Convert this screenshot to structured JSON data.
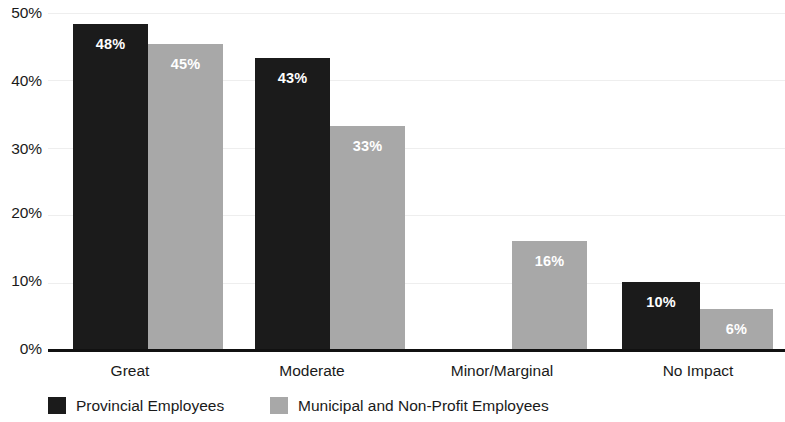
{
  "chart_data": {
    "type": "bar",
    "title": "",
    "subtitle": "",
    "xlabel": "",
    "ylabel": "",
    "categories": [
      "Great",
      "Moderate",
      "Minor/Marginal",
      "No Impact"
    ],
    "series": [
      {
        "name": "Provincial Employees",
        "color": "#1b1b1b",
        "values": [
          48,
          43,
          0,
          10
        ],
        "labels": [
          "48%",
          "43%",
          "",
          "10%"
        ]
      },
      {
        "name": "Municipal and Non-Profit Employees",
        "color": "#a8a8a8",
        "values": [
          45,
          33,
          16,
          6
        ],
        "labels": [
          "45%",
          "33%",
          "16%",
          "6%"
        ]
      }
    ],
    "ylim": [
      0,
      50
    ],
    "ytick_values": [
      0,
      10,
      20,
      30,
      40,
      50
    ],
    "ytick_labels": [
      "0%",
      "10%",
      "20%",
      "30%",
      "40%",
      "50%"
    ],
    "grid": true,
    "grid_color": "#eeeeee",
    "legend_position": "bottom",
    "axis_color": "#111111",
    "background": "#ffffff"
  },
  "axis": {
    "ticks": [
      {
        "label": "50%",
        "top": 5
      },
      {
        "label": "40%",
        "top": 73
      },
      {
        "label": "30%",
        "top": 141
      },
      {
        "label": "20%",
        "top": 205
      },
      {
        "label": "10%",
        "top": 273
      },
      {
        "label": "0%",
        "top": 341
      }
    ]
  },
  "categories": [
    {
      "label": "Great",
      "left": 40,
      "width": 180
    },
    {
      "label": "Moderate",
      "left": 222,
      "width": 180
    },
    {
      "label": "Minor/Marginal",
      "left": 412,
      "width": 180
    },
    {
      "label": "No Impact",
      "left": 608,
      "width": 180
    }
  ],
  "bars": [
    {
      "series": "provincial",
      "category": "Great",
      "label": "48%",
      "left": 25,
      "width": 75,
      "height": 326,
      "tone": "dark",
      "show_label": true
    },
    {
      "series": "municipal",
      "category": "Great",
      "label": "45%",
      "left": 100,
      "width": 75,
      "height": 306,
      "tone": "light",
      "show_label": true
    },
    {
      "series": "provincial",
      "category": "Moderate",
      "label": "43%",
      "left": 207,
      "width": 75,
      "height": 292,
      "tone": "dark",
      "show_label": true
    },
    {
      "series": "municipal",
      "category": "Moderate",
      "label": "33%",
      "left": 282,
      "width": 75,
      "height": 224,
      "tone": "light",
      "show_label": true
    },
    {
      "series": "municipal",
      "category": "Minor/Marginal",
      "label": "16%",
      "left": 464,
      "width": 75,
      "height": 109,
      "tone": "light",
      "show_label": true
    },
    {
      "series": "provincial",
      "category": "No Impact",
      "label": "10%",
      "left": 574,
      "width": 78,
      "height": 68,
      "tone": "dark",
      "show_label": true
    },
    {
      "series": "municipal",
      "category": "No Impact",
      "label": "6%",
      "left": 652,
      "width": 73,
      "height": 41,
      "tone": "light",
      "show_label": true
    }
  ],
  "gridlines": [
    {
      "top": 0
    },
    {
      "top": 67
    },
    {
      "top": 135
    },
    {
      "top": 202
    },
    {
      "top": 270
    }
  ],
  "legend": {
    "items": [
      {
        "label": "Provincial Employees",
        "tone": "dark",
        "left": 48
      },
      {
        "label": "Municipal and Non-Profit Employees",
        "tone": "light",
        "left": 270
      }
    ]
  }
}
